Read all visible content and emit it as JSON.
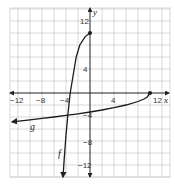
{
  "chart_data": {
    "type": "line",
    "title": "",
    "xlabel": "x",
    "ylabel": "y",
    "xlim": [
      -13.5,
      13.5
    ],
    "ylim": [
      -14,
      14
    ],
    "grid": true,
    "grid_step": 2,
    "x_ticks": [
      -12,
      -8,
      -4,
      4,
      12
    ],
    "y_ticks": [
      12,
      4,
      -4,
      -8,
      -12
    ],
    "x_tick_labels": [
      "−12",
      "−8",
      "−4",
      "4",
      "12"
    ],
    "y_tick_labels": [
      "12",
      "4",
      "−4",
      "−8",
      "−12"
    ],
    "series": [
      {
        "name": "f",
        "label": "f",
        "endpoint": [
          0,
          10
        ],
        "endpoint_closed": true,
        "arrow_end": "down",
        "points": [
          [
            0,
            10
          ],
          [
            -0.8,
            9.4
          ],
          [
            -1.7,
            8
          ],
          [
            -2.3,
            6
          ],
          [
            -2.8,
            3
          ],
          [
            -3.3,
            0
          ],
          [
            -3.7,
            -3.7
          ],
          [
            -4.0,
            -7
          ],
          [
            -4.3,
            -11
          ],
          [
            -4.5,
            -14
          ]
        ]
      },
      {
        "name": "g",
        "label": "g",
        "endpoint": [
          10,
          0
        ],
        "endpoint_closed": true,
        "arrow_end": "left",
        "points": [
          [
            10,
            0
          ],
          [
            9.5,
            -0.7
          ],
          [
            9,
            -1
          ],
          [
            8,
            -1.41
          ],
          [
            6,
            -2
          ],
          [
            4,
            -2.45
          ],
          [
            2,
            -2.83
          ],
          [
            0,
            -3.16
          ],
          [
            -2,
            -3.46
          ],
          [
            -4,
            -3.74
          ],
          [
            -6,
            -4
          ],
          [
            -8,
            -4.24
          ],
          [
            -10,
            -4.47
          ],
          [
            -13,
            -4.8
          ]
        ]
      }
    ],
    "colors": {
      "curve": "#1a1a1a",
      "axis": "#222222",
      "grid": "#c8c8c8"
    }
  },
  "labels": {
    "x_axis": "x",
    "y_axis": "y",
    "f_label": "f",
    "g_label": "g",
    "xt_m12": "−12",
    "xt_m8": "−8",
    "xt_m4": "−4",
    "xt_4": "4",
    "xt_12": "12",
    "yt_12": "12",
    "yt_4": "4",
    "yt_m4": "−4",
    "yt_m8": "−8",
    "yt_m12": "−12"
  }
}
